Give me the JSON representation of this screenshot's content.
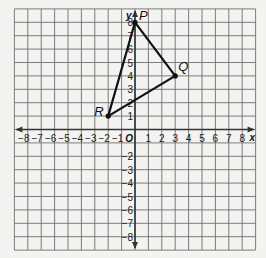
{
  "diagram": {
    "type": "coordinate-plane",
    "x_axis": {
      "label": "x",
      "min": -8,
      "max": 8,
      "ticks": [
        "-8",
        "-7",
        "-6",
        "-5",
        "-4",
        "-3",
        "-2",
        "-1",
        "1",
        "2",
        "3",
        "4",
        "5",
        "6",
        "7",
        "8"
      ]
    },
    "y_axis": {
      "label": "y",
      "min": -8,
      "max": 8,
      "ticks": [
        "8",
        "7",
        "6",
        "5",
        "4",
        "3",
        "2",
        "1",
        "-2",
        "-3",
        "-4",
        "-5",
        "-6",
        "-7",
        "-8"
      ]
    },
    "origin_label": "O",
    "grid_range": [
      -9,
      9
    ],
    "points": [
      {
        "label": "P",
        "x": 0,
        "y": 8
      },
      {
        "label": "Q",
        "x": 3,
        "y": 4
      },
      {
        "label": "R",
        "x": -2,
        "y": 1
      }
    ],
    "polygon": [
      "P",
      "Q",
      "R"
    ],
    "colors": {
      "grid": "#6e6e6e",
      "axes": "#333333",
      "triangle": "#111111",
      "background": "#f3f3f1"
    }
  }
}
